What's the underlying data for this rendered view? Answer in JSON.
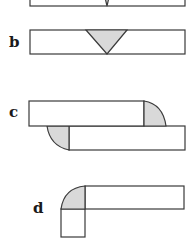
{
  "figure": {
    "type": "weld joint diagram",
    "panels": [
      {
        "label": "a",
        "joint": "butt joint (V-groove)",
        "label_visible": false
      },
      {
        "label": "b",
        "joint": "butt joint (V-groove)",
        "label_visible": true
      },
      {
        "label": "c",
        "joint": "lap joint (fillet welds)",
        "label_visible": true
      },
      {
        "label": "d",
        "joint": "corner joint (fillet weld)",
        "label_visible": true
      }
    ]
  },
  "colors": {
    "weld_fill": "#d9d9d9",
    "outline": "#3a3a3a",
    "background": "#ffffff"
  }
}
